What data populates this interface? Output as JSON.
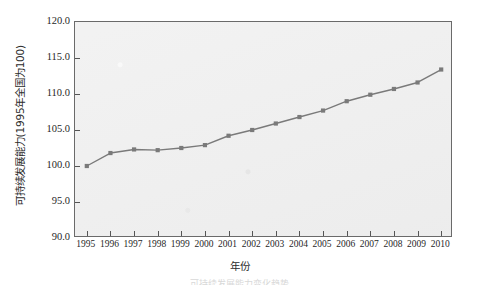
{
  "chart_data": {
    "type": "line",
    "title": "",
    "xlabel": "年份",
    "ylabel": "可持续发展能力(1995年全国为100)",
    "xlim": [
      1994.5,
      2010.5
    ],
    "ylim": [
      90.0,
      120.0
    ],
    "grid": false,
    "legend": null,
    "series_color": "#7a7a7a",
    "marker": "square",
    "plot_background": "#eeeeee",
    "categories": [
      "1995",
      "1996",
      "1997",
      "1998",
      "1999",
      "2000",
      "2001",
      "2002",
      "2003",
      "2004",
      "2005",
      "2006",
      "2007",
      "2008",
      "2009",
      "2010"
    ],
    "x": [
      1995,
      1996,
      1997,
      1998,
      1999,
      2000,
      2001,
      2002,
      2003,
      2004,
      2005,
      2006,
      2007,
      2008,
      2009,
      2010
    ],
    "values": [
      100.0,
      101.8,
      102.3,
      102.2,
      102.5,
      102.9,
      104.2,
      105.0,
      105.9,
      106.8,
      107.7,
      109.0,
      109.9,
      110.7,
      111.6,
      113.4
    ],
    "ytick_labels": [
      "120.0",
      "115.0",
      "110.0",
      "105.0",
      "100.0",
      "95.0",
      "90.0"
    ],
    "ytick_values": [
      120.0,
      115.0,
      110.0,
      105.0,
      100.0,
      95.0,
      90.0
    ],
    "xtick_labels": [
      "1995",
      "1996",
      "1997",
      "1998",
      "1999",
      "2000",
      "2001",
      "2002",
      "2003",
      "2004",
      "2005",
      "2006",
      "2007",
      "2008",
      "2009",
      "2010"
    ]
  },
  "caption": "可持续发展能力变化趋势"
}
